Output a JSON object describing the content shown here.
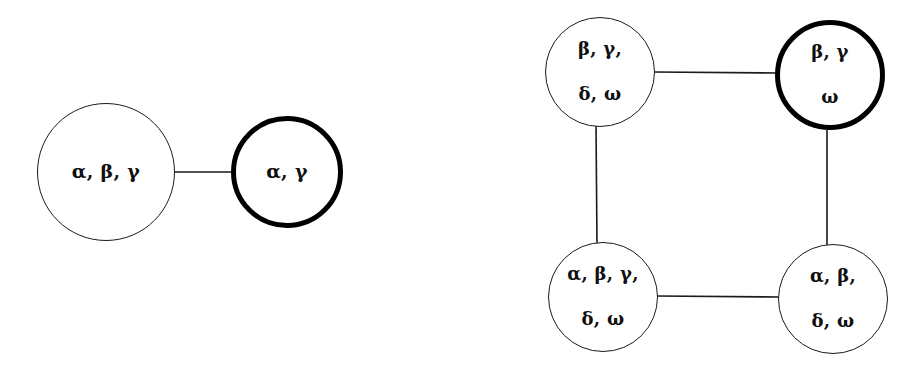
{
  "figure": {
    "type": "graph-diagram",
    "background_color": "#ffffff",
    "stroke_color": "#000000"
  },
  "graphs": [
    {
      "id": "left-graph",
      "name": "two-node-graph",
      "nodes": [
        {
          "id": "L1",
          "name": "node-alpha-beta-gamma",
          "lines": [
            "α, β, γ"
          ],
          "border": "thin",
          "cx": 106,
          "cy": 172,
          "r": 69,
          "font_size": 19
        },
        {
          "id": "L2",
          "name": "node-alpha-gamma-highlighted",
          "lines": [
            "α, γ"
          ],
          "border": "thick",
          "cx": 287,
          "cy": 172,
          "r": 56,
          "font_size": 19
        }
      ],
      "edges": [
        {
          "id": "L-e1",
          "name": "edge-L1-L2",
          "from": "L1",
          "to": "L2",
          "x1": 175,
          "y1": 172,
          "x2": 231,
          "y2": 172,
          "width": 1.6
        }
      ]
    },
    {
      "id": "right-graph",
      "name": "four-node-cycle-graph",
      "nodes": [
        {
          "id": "R1",
          "name": "node-beta-gamma-delta-omega",
          "lines": [
            "β, γ,",
            "δ, ω"
          ],
          "border": "thin",
          "cx": 600,
          "cy": 72,
          "r": 55,
          "font_size": 18
        },
        {
          "id": "R2",
          "name": "node-beta-gamma-omega-highlighted",
          "lines": [
            "β, γ",
            "ω"
          ],
          "border": "thick",
          "cx": 830,
          "cy": 75,
          "r": 55,
          "font_size": 18
        },
        {
          "id": "R3",
          "name": "node-alpha-beta-gamma-delta-omega",
          "lines": [
            "α, β, γ,",
            "δ, ω"
          ],
          "border": "thin",
          "cx": 603,
          "cy": 297,
          "r": 55,
          "font_size": 18
        },
        {
          "id": "R4",
          "name": "node-alpha-beta-delta-omega",
          "lines": [
            "α, β,",
            "δ, ω"
          ],
          "border": "thin",
          "cx": 833,
          "cy": 299,
          "r": 55,
          "font_size": 18
        }
      ],
      "edges": [
        {
          "id": "R-e1",
          "name": "edge-R1-R2-top",
          "from": "R1",
          "to": "R2",
          "x1": 654,
          "y1": 72,
          "x2": 777,
          "y2": 73,
          "width": 1.6
        },
        {
          "id": "R-e2",
          "name": "edge-R1-R3-left",
          "from": "R1",
          "to": "R3",
          "x1": 596,
          "y1": 124,
          "x2": 597,
          "y2": 246,
          "width": 1.6
        },
        {
          "id": "R-e3",
          "name": "edge-R2-R4-right",
          "from": "R2",
          "to": "R4",
          "x1": 827,
          "y1": 130,
          "x2": 827,
          "y2": 248,
          "width": 1.6
        },
        {
          "id": "R-e4",
          "name": "edge-R3-R4-bottom",
          "from": "R3",
          "to": "R4",
          "x1": 657,
          "y1": 296,
          "x2": 780,
          "y2": 297,
          "width": 1.6
        }
      ]
    }
  ]
}
